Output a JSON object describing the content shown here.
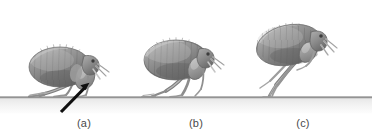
{
  "figure": {
    "kind": "scientific-illustration",
    "background_color": "#ffffff",
    "width": 372,
    "height": 134
  },
  "ground": {
    "name": "ground-line",
    "y": 97,
    "x_start": 0,
    "x_end": 372,
    "line_color": "#6e6e6e",
    "band_color_top": "#e9e9e9",
    "band_color_bottom": "#fbfbfb",
    "band_height": 16
  },
  "palette": {
    "body_dark": "#6d6d6d",
    "body_mid": "#8d8d8d",
    "body_light": "#b4b4b4",
    "body_highlight": "#cfcfcf",
    "outline": "#5a5a5a",
    "leg": "#9a9a9a",
    "leg_dark": "#6f6f6f",
    "bristle": "#d8d8d8",
    "eye": "#3c3c3c",
    "arrow": "#101010",
    "label_text": "#4a4a4a"
  },
  "panels": [
    {
      "id": "a",
      "label": "(a)",
      "label_x": 84,
      "label_y": 117,
      "caption_stage": "crouched, hind leg compressed against ground",
      "flea_center_x": 62,
      "flea_center_y": 66,
      "body_tilt_deg": 0
    },
    {
      "id": "b",
      "label": "(b)",
      "label_x": 196,
      "label_y": 117,
      "caption_stage": "mid extension, hind leg pushing off",
      "flea_center_x": 177,
      "flea_center_y": 60,
      "body_tilt_deg": -4
    },
    {
      "id": "c",
      "label": "(c)",
      "label_x": 303,
      "label_y": 117,
      "caption_stage": "full extension, body lifted, legs straightened",
      "flea_center_x": 290,
      "flea_center_y": 44,
      "body_tilt_deg": -12
    }
  ],
  "annotations": [
    {
      "name": "hind-leg-arrow",
      "type": "arrow",
      "target": "hind leg of flea (a)",
      "tail_x": 61,
      "tail_y": 112,
      "head_x": 89,
      "head_y": 83,
      "color": "#101010",
      "shaft_width": 3.2,
      "head_length": 11,
      "head_width": 9
    }
  ]
}
